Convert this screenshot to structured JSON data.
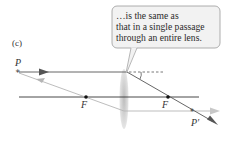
{
  "panel_label": "(c)",
  "callout": {
    "lines": [
      "…is the same as",
      "that in a single passage",
      "through an entire lens."
    ]
  },
  "labels": {
    "object_point": "P",
    "image_point": "P′",
    "focal_left": "F",
    "focal_right": "F"
  },
  "colors": {
    "main_ray": "#555555",
    "secondary_ray": "#b5b5b5",
    "axis": "#333333",
    "lens": "#c8c8c8",
    "callout_fill": "#f2f2f2",
    "callout_border": "#9a9a9a"
  }
}
